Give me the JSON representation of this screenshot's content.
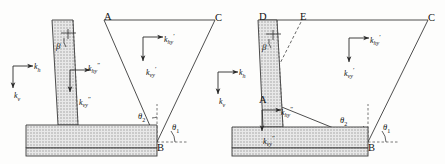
{
  "figure": {
    "type": "engineering-diagram",
    "panels": [
      {
        "id": "left",
        "points": [
          {
            "name": "A",
            "label": "A",
            "x": 104,
            "y": 12
          },
          {
            "name": "B",
            "label": "B",
            "x": 157,
            "y": 143
          },
          {
            "name": "C",
            "label": "C",
            "x": 215,
            "y": 13
          }
        ],
        "angles": [
          {
            "name": "theta2",
            "base": "θ",
            "sub": "2",
            "x": 138,
            "y": 112
          },
          {
            "name": "theta1",
            "base": "θ",
            "sub": "1",
            "x": 172,
            "y": 123
          },
          {
            "name": "beta",
            "base": "β",
            "x": 56,
            "y": 42
          }
        ],
        "forces": [
          {
            "name": "kh",
            "base": "k",
            "sub": "h",
            "sup": "",
            "x": 34,
            "y": 63
          },
          {
            "name": "kv",
            "base": "k",
            "sub": "v",
            "sup": "",
            "x": 14,
            "y": 92
          },
          {
            "name": "khy-dprime",
            "base": "k",
            "sub": "hy",
            "sup": "″",
            "x": 88,
            "y": 62
          },
          {
            "name": "kvy-dprime",
            "base": "k",
            "sub": "vy",
            "sup": "″",
            "x": 79,
            "y": 96
          },
          {
            "name": "khy-prime",
            "base": "k",
            "sub": "hy",
            "sup": "′",
            "x": 164,
            "y": 33
          },
          {
            "name": "kvy-prime",
            "base": "k",
            "sub": "vy",
            "sup": "′",
            "x": 146,
            "y": 66
          }
        ]
      },
      {
        "id": "right",
        "points": [
          {
            "name": "D",
            "label": "D",
            "x": 259,
            "y": 12
          },
          {
            "name": "E",
            "label": "E",
            "x": 300,
            "y": 12
          },
          {
            "name": "A",
            "label": "A",
            "x": 259,
            "y": 95
          },
          {
            "name": "B",
            "label": "B",
            "x": 368,
            "y": 143
          },
          {
            "name": "C",
            "label": "C",
            "x": 428,
            "y": 13
          }
        ],
        "angles": [
          {
            "name": "theta2",
            "base": "θ",
            "sub": "2",
            "x": 340,
            "y": 116
          },
          {
            "name": "theta1",
            "base": "θ",
            "sub": "1",
            "x": 383,
            "y": 123
          },
          {
            "name": "beta",
            "base": "β",
            "x": 262,
            "y": 43
          }
        ],
        "forces": [
          {
            "name": "kh",
            "base": "k",
            "sub": "h",
            "sup": "",
            "x": 239,
            "y": 69
          },
          {
            "name": "kv",
            "base": "k",
            "sub": "v",
            "sup": "",
            "x": 219,
            "y": 98
          },
          {
            "name": "khy-dprime",
            "base": "k",
            "sub": "hy",
            "sup": "″",
            "x": 281,
            "y": 106
          },
          {
            "name": "kvy-dprime",
            "base": "k",
            "sub": "vy",
            "sup": "″",
            "x": 263,
            "y": 135
          },
          {
            "name": "khy-prime",
            "base": "k",
            "sub": "hy",
            "sup": "′",
            "x": 370,
            "y": 34
          },
          {
            "name": "kvy-prime",
            "base": "k",
            "sub": "vy",
            "sup": "′",
            "x": 344,
            "y": 67
          }
        ]
      }
    ],
    "colors": {
      "line": "#3a3a3a",
      "hatch": "#9a9a9a",
      "fill": "#e2e2e2",
      "text": "#111111",
      "background": "#fdfdfc"
    }
  }
}
